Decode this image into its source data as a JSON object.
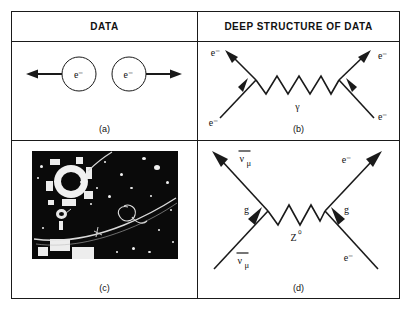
{
  "figure": {
    "headers": {
      "left": "DATA",
      "right": "DEEP STRUCTURE OF DATA"
    },
    "panels": [
      {
        "id": "a",
        "caption": "(a)",
        "type": "schematic",
        "description": "Two electrons recoiling in opposite directions",
        "particles": [
          {
            "label": "e⁻",
            "position": "left-circle",
            "arrow": "left"
          },
          {
            "label": "e⁻",
            "position": "right-circle",
            "arrow": "right"
          }
        ]
      },
      {
        "id": "b",
        "caption": "(b)",
        "type": "feynman-diagram",
        "description": "Electron-electron scattering via photon exchange",
        "exchange_boson": "γ",
        "legs": [
          {
            "label": "e⁻",
            "position": "upper-left"
          },
          {
            "label": "e⁻",
            "position": "upper-right"
          },
          {
            "label": "e⁻",
            "position": "lower-left"
          },
          {
            "label": "e⁻",
            "position": "lower-right"
          }
        ]
      },
      {
        "id": "c",
        "caption": "(c)",
        "type": "bubble-chamber-photograph",
        "description": "Bubble chamber photograph with bright ring and particle tracks"
      },
      {
        "id": "d",
        "caption": "(d)",
        "type": "feynman-diagram",
        "description": "Antimuon-neutrino electron scattering via Z-zero exchange",
        "exchange_boson": "Z⁰",
        "couplings": [
          {
            "label": "g",
            "position": "left-vertex"
          },
          {
            "label": "g",
            "position": "right-vertex"
          }
        ],
        "legs": [
          {
            "label": "νμ-bar",
            "display": "ν",
            "subscript": "μ",
            "overbar": true,
            "position": "upper-left"
          },
          {
            "label": "e⁻",
            "display": "e⁻",
            "position": "upper-right"
          },
          {
            "label": "νμ-bar",
            "display": "ν",
            "subscript": "μ",
            "overbar": true,
            "position": "lower-left"
          },
          {
            "label": "e⁻",
            "display": "e⁻",
            "position": "lower-right"
          }
        ]
      }
    ],
    "symbols": {
      "electron": "e⁻",
      "photon": "γ",
      "z_boson": "Z",
      "z_superscript": "⁰",
      "neutrino": "ν",
      "mu_subscript": "μ",
      "coupling": "g"
    },
    "colors": {
      "ink": "#1a1a1a",
      "paper": "#ffffff",
      "photo_background": "#0a0a0a",
      "photo_tracks": "#f0f0f0"
    }
  }
}
